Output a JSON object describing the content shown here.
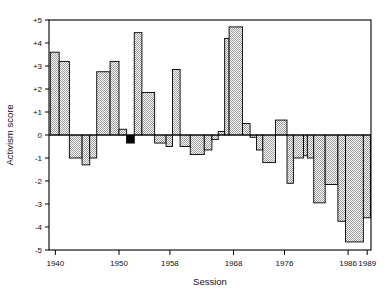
{
  "chart_data": {
    "type": "bar",
    "title": "",
    "xlabel": "Session",
    "ylabel": "Activism score",
    "xlim": [
      1939,
      1989.6
    ],
    "ylim": [
      -5,
      5
    ],
    "grid": false,
    "legend": null,
    "xticks": [
      1940,
      1950,
      1958,
      1968,
      1976,
      1986,
      1989
    ],
    "xtick_labels": [
      "1940",
      "1950",
      "1958",
      "1968",
      "1976",
      "1986",
      "1989"
    ],
    "yticks": [
      5,
      4,
      3,
      2,
      1,
      0,
      -1,
      -2,
      -3,
      -4,
      -5
    ],
    "ytick_labels": [
      "+5",
      "+4",
      "+3",
      "+2",
      "+1",
      "0",
      "-1",
      "-2",
      "-3",
      "-4",
      "-5"
    ],
    "bar_fill_pattern": "stipple-gray",
    "bar_fill_color": "#c9c9c9",
    "bar_edge_color": "#000000",
    "highlight_fill_color": "#000000",
    "x": [
      1939.2,
      1941.2,
      1943.2,
      1945.2,
      1947.2,
      1949.2,
      1951.2,
      1953.2,
      1955.2,
      1957.2,
      1959.2,
      1961.2,
      1963.2,
      1965.2,
      1967.2,
      1969.2,
      1971.2,
      1973.2,
      1975.2,
      1977.2,
      1979.2,
      1981.2,
      1983.2,
      1985.2,
      1987.2
    ],
    "categories": [
      "1939-40",
      "1941-42",
      "1943-44",
      "1945-46",
      "1947-48",
      "1949-50",
      "1951-52",
      "1953-54",
      "1955-56",
      "1957-58",
      "1959-60",
      "1961-62",
      "1963-64",
      "1965-66",
      "1967-68",
      "1969-70",
      "1971-72",
      "1973-74",
      "1975-76",
      "1977-78",
      "1979-80",
      "1981-82",
      "1983-84",
      "1985-86",
      "1987-89"
    ],
    "values": [
      3.6,
      3.2,
      -1.0,
      -1.3,
      2.75,
      3.2,
      0.25,
      -0.35,
      4.45,
      1.85,
      -0.35,
      -0.5,
      2.85,
      -0.5,
      -0.85,
      -0.65,
      -0.2,
      0.15,
      4.2,
      4.7,
      0.5,
      -0.1,
      -0.65,
      -1.2,
      -2.1
    ],
    "values_note": "step-chart: each congressional session is a bar spanning two years",
    "steps": [
      {
        "x0": 1939.2,
        "x1": 1940.6,
        "y": 3.6,
        "fill": "stipple"
      },
      {
        "x0": 1940.6,
        "x1": 1942.2,
        "y": 3.2,
        "fill": "stipple"
      },
      {
        "x0": 1942.2,
        "x1": 1944.2,
        "y": -1.0,
        "fill": "stipple"
      },
      {
        "x0": 1944.2,
        "x1": 1945.4,
        "y": -1.3,
        "fill": "stipple"
      },
      {
        "x0": 1945.4,
        "x1": 1946.5,
        "y": -1.0,
        "fill": "stipple"
      },
      {
        "x0": 1946.5,
        "x1": 1948.6,
        "y": 2.75,
        "fill": "stipple"
      },
      {
        "x0": 1948.6,
        "x1": 1950.0,
        "y": 3.2,
        "fill": "stipple"
      },
      {
        "x0": 1950.0,
        "x1": 1951.2,
        "y": 0.25,
        "fill": "stipple"
      },
      {
        "x0": 1951.2,
        "x1": 1952.4,
        "y": -0.35,
        "fill": "solid-black"
      },
      {
        "x0": 1952.4,
        "x1": 1953.6,
        "y": 4.45,
        "fill": "stipple"
      },
      {
        "x0": 1953.6,
        "x1": 1955.6,
        "y": 1.85,
        "fill": "stipple"
      },
      {
        "x0": 1955.6,
        "x1": 1957.4,
        "y": -0.35,
        "fill": "stipple"
      },
      {
        "x0": 1957.4,
        "x1": 1958.4,
        "y": -0.5,
        "fill": "stipple"
      },
      {
        "x0": 1958.4,
        "x1": 1959.6,
        "y": 2.85,
        "fill": "stipple"
      },
      {
        "x0": 1959.6,
        "x1": 1961.2,
        "y": -0.5,
        "fill": "stipple"
      },
      {
        "x0": 1961.2,
        "x1": 1963.4,
        "y": -0.85,
        "fill": "stipple"
      },
      {
        "x0": 1963.4,
        "x1": 1964.6,
        "y": -0.65,
        "fill": "stipple"
      },
      {
        "x0": 1964.6,
        "x1": 1965.6,
        "y": -0.2,
        "fill": "stipple"
      },
      {
        "x0": 1965.6,
        "x1": 1966.6,
        "y": 0.15,
        "fill": "stipple"
      },
      {
        "x0": 1966.6,
        "x1": 1967.3,
        "y": 4.2,
        "fill": "stipple"
      },
      {
        "x0": 1967.3,
        "x1": 1969.4,
        "y": 4.7,
        "fill": "stipple"
      },
      {
        "x0": 1969.4,
        "x1": 1970.6,
        "y": 0.5,
        "fill": "stipple"
      },
      {
        "x0": 1970.6,
        "x1": 1971.6,
        "y": -0.1,
        "fill": "stipple"
      },
      {
        "x0": 1971.6,
        "x1": 1972.6,
        "y": -0.65,
        "fill": "stipple"
      },
      {
        "x0": 1972.6,
        "x1": 1974.6,
        "y": -1.2,
        "fill": "stipple"
      },
      {
        "x0": 1974.6,
        "x1": 1976.4,
        "y": 0.65,
        "fill": "stipple"
      },
      {
        "x0": 1976.4,
        "x1": 1977.4,
        "y": -2.1,
        "fill": "stipple"
      },
      {
        "x0": 1977.4,
        "x1": 1979.0,
        "y": -1.0,
        "fill": "stipple"
      },
      {
        "x0": 1979.0,
        "x1": 1979.6,
        "y": -0.9,
        "fill": "stipple"
      },
      {
        "x0": 1979.6,
        "x1": 1980.6,
        "y": -1.0,
        "fill": "stipple"
      },
      {
        "x0": 1980.6,
        "x1": 1982.4,
        "y": -2.95,
        "fill": "stipple"
      },
      {
        "x0": 1982.4,
        "x1": 1984.4,
        "y": -2.15,
        "fill": "stipple"
      },
      {
        "x0": 1984.4,
        "x1": 1985.6,
        "y": -3.75,
        "fill": "stipple"
      },
      {
        "x0": 1985.6,
        "x1": 1988.4,
        "y": -4.65,
        "fill": "stipple"
      },
      {
        "x0": 1988.4,
        "x1": 1989.5,
        "y": -3.6,
        "fill": "stipple"
      }
    ]
  },
  "axes": {
    "y_title": "Activism score",
    "x_title": "Session"
  }
}
